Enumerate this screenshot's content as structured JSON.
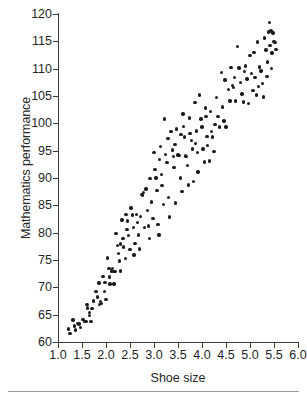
{
  "chart_data": {
    "type": "scatter",
    "title": "",
    "xlabel": "Shoe size",
    "ylabel": "Mathematics performance",
    "xlim": [
      1.0,
      6.0
    ],
    "ylim": [
      60,
      120
    ],
    "grid": false,
    "legend": null,
    "xticks": [
      "1.0",
      "1.5",
      "2.0",
      "2.5",
      "3.0",
      "3.5",
      "4.0",
      "4.5",
      "5.0",
      "5.5",
      "6.0"
    ],
    "xtick_values": [
      1.0,
      1.5,
      2.0,
      2.5,
      3.0,
      3.5,
      4.0,
      4.5,
      5.0,
      5.5,
      6.0
    ],
    "yticks": [
      "60",
      "65",
      "70",
      "75",
      "80",
      "85",
      "90",
      "95",
      "100",
      "105",
      "110",
      "115",
      "120"
    ],
    "ytick_values": [
      60,
      65,
      70,
      75,
      80,
      85,
      90,
      95,
      100,
      105,
      110,
      115,
      120
    ],
    "marker": "filled-circle",
    "marker_color": "#1c1c1c",
    "marker_size_px": 3.4,
    "n_points": 184,
    "points": [
      [
        1.22,
        62.4
      ],
      [
        1.25,
        61.6
      ],
      [
        1.31,
        64.0
      ],
      [
        1.34,
        62.9
      ],
      [
        1.36,
        62.2
      ],
      [
        1.44,
        63.3
      ],
      [
        1.47,
        62.6
      ],
      [
        1.52,
        64.1
      ],
      [
        1.55,
        63.8
      ],
      [
        1.58,
        63.7
      ],
      [
        1.6,
        66.9
      ],
      [
        1.62,
        66.2
      ],
      [
        1.66,
        65.4
      ],
      [
        1.69,
        63.8
      ],
      [
        1.71,
        66.1
      ],
      [
        1.74,
        67.5
      ],
      [
        1.79,
        69.2
      ],
      [
        1.82,
        68.2
      ],
      [
        1.85,
        70.8
      ],
      [
        1.86,
        66.9
      ],
      [
        1.88,
        67.4
      ],
      [
        1.9,
        67.0
      ],
      [
        1.94,
        72.0
      ],
      [
        1.98,
        70.9
      ],
      [
        2.0,
        67.8
      ],
      [
        2.03,
        75.4
      ],
      [
        2.06,
        73.4
      ],
      [
        2.08,
        70.6
      ],
      [
        2.11,
        73.0
      ],
      [
        2.13,
        73.4
      ],
      [
        2.15,
        72.9
      ],
      [
        2.17,
        70.6
      ],
      [
        2.19,
        72.9
      ],
      [
        2.21,
        79.8
      ],
      [
        2.24,
        77.6
      ],
      [
        2.26,
        76.2
      ],
      [
        2.28,
        74.8
      ],
      [
        2.3,
        73.0
      ],
      [
        2.33,
        82.3
      ],
      [
        2.35,
        78.9
      ],
      [
        2.37,
        77.4
      ],
      [
        2.4,
        75.3
      ],
      [
        2.42,
        83.3
      ],
      [
        2.45,
        82.1
      ],
      [
        2.47,
        79.5
      ],
      [
        2.5,
        76.9
      ],
      [
        2.52,
        84.5
      ],
      [
        2.55,
        83.2
      ],
      [
        2.57,
        81.0
      ],
      [
        2.6,
        78.0
      ],
      [
        2.63,
        83.3
      ],
      [
        2.66,
        81.9
      ],
      [
        2.68,
        79.6
      ],
      [
        2.7,
        77.0
      ],
      [
        2.74,
        87.0
      ],
      [
        2.76,
        86.9
      ],
      [
        2.78,
        87.3
      ],
      [
        2.8,
        80.9
      ],
      [
        2.83,
        88.0
      ],
      [
        2.86,
        84.1
      ],
      [
        2.88,
        81.2
      ],
      [
        2.92,
        89.9
      ],
      [
        2.95,
        85.6
      ],
      [
        2.98,
        82.6
      ],
      [
        3.0,
        94.7
      ],
      [
        3.02,
        91.6
      ],
      [
        3.04,
        90.0
      ],
      [
        3.06,
        87.7
      ],
      [
        3.08,
        81.5
      ],
      [
        3.1,
        79.6
      ],
      [
        3.12,
        93.4
      ],
      [
        3.15,
        90.6
      ],
      [
        3.17,
        88.6
      ],
      [
        3.2,
        85.2
      ],
      [
        3.22,
        100.8
      ],
      [
        3.24,
        94.3
      ],
      [
        3.27,
        92.8
      ],
      [
        3.3,
        86.4
      ],
      [
        3.32,
        82.9
      ],
      [
        3.35,
        98.5
      ],
      [
        3.38,
        95.1
      ],
      [
        3.4,
        93.9
      ],
      [
        3.42,
        91.9
      ],
      [
        3.45,
        85.4
      ],
      [
        3.47,
        99.0
      ],
      [
        3.5,
        94.2
      ],
      [
        3.52,
        94.1
      ],
      [
        3.55,
        90.0
      ],
      [
        3.58,
        87.5
      ],
      [
        3.6,
        101.7
      ],
      [
        3.62,
        99.4
      ],
      [
        3.64,
        97.5
      ],
      [
        3.66,
        94.0
      ],
      [
        3.68,
        93.9
      ],
      [
        3.7,
        92.3
      ],
      [
        3.72,
        88.7
      ],
      [
        3.75,
        98.1
      ],
      [
        3.78,
        96.9
      ],
      [
        3.8,
        95.3
      ],
      [
        3.82,
        89.4
      ],
      [
        3.85,
        103.8
      ],
      [
        3.88,
        98.6
      ],
      [
        3.9,
        94.7
      ],
      [
        3.92,
        91.1
      ],
      [
        3.95,
        105.2
      ],
      [
        3.98,
        100.8
      ],
      [
        4.0,
        99.3
      ],
      [
        4.02,
        95.3
      ],
      [
        4.05,
        92.9
      ],
      [
        4.08,
        101.2
      ],
      [
        4.1,
        97.6
      ],
      [
        4.12,
        96.0
      ],
      [
        4.15,
        93.1
      ],
      [
        4.18,
        102.2
      ],
      [
        4.2,
        98.5
      ],
      [
        4.22,
        97.5
      ],
      [
        4.25,
        94.8
      ],
      [
        4.3,
        104.7
      ],
      [
        4.33,
        101.2
      ],
      [
        4.36,
        99.3
      ],
      [
        4.4,
        109.3
      ],
      [
        4.43,
        103.0
      ],
      [
        4.46,
        100.4
      ],
      [
        4.5,
        99.3
      ],
      [
        4.55,
        106.2
      ],
      [
        4.58,
        104.1
      ],
      [
        4.6,
        110.2
      ],
      [
        4.63,
        106.9
      ],
      [
        4.66,
        106.6
      ],
      [
        4.7,
        104.1
      ],
      [
        4.74,
        114.1
      ],
      [
        4.77,
        110.1
      ],
      [
        4.8,
        107.5
      ],
      [
        4.83,
        105.4
      ],
      [
        4.86,
        103.9
      ],
      [
        4.9,
        110.5
      ],
      [
        4.94,
        108.1
      ],
      [
        4.97,
        103.6
      ],
      [
        5.0,
        112.4
      ],
      [
        5.03,
        109.1
      ],
      [
        5.06,
        106.0
      ],
      [
        5.1,
        108.4
      ],
      [
        5.13,
        105.2
      ],
      [
        5.16,
        114.9
      ],
      [
        5.2,
        110.3
      ],
      [
        5.23,
        109.6
      ],
      [
        5.26,
        107.3
      ],
      [
        5.3,
        115.6
      ],
      [
        5.33,
        113.4
      ],
      [
        5.36,
        111.2
      ],
      [
        5.38,
        116.7
      ],
      [
        5.4,
        118.5
      ],
      [
        5.42,
        114.2
      ],
      [
        5.44,
        116.9
      ],
      [
        5.46,
        112.9
      ],
      [
        5.48,
        116.5
      ],
      [
        5.5,
        115.0
      ],
      [
        5.52,
        114.8
      ],
      [
        5.54,
        113.5
      ],
      [
        2.44,
        80.6
      ],
      [
        2.58,
        75.9
      ],
      [
        2.72,
        83.0
      ],
      [
        2.9,
        78.9
      ],
      [
        3.14,
        95.8
      ],
      [
        3.29,
        97.2
      ],
      [
        3.44,
        96.1
      ],
      [
        3.56,
        98.0
      ],
      [
        3.74,
        101.0
      ],
      [
        3.86,
        96.3
      ],
      [
        4.07,
        102.8
      ],
      [
        4.27,
        99.8
      ],
      [
        4.48,
        107.9
      ],
      [
        4.68,
        108.4
      ],
      [
        4.88,
        109.5
      ],
      [
        5.08,
        113.0
      ],
      [
        5.18,
        106.7
      ],
      [
        5.28,
        104.8
      ],
      [
        5.35,
        108.6
      ],
      [
        5.45,
        110.0
      ],
      [
        2.07,
        71.9
      ],
      [
        2.3,
        77.9
      ],
      [
        1.41,
        63.4
      ],
      [
        1.65,
        64.9
      ],
      [
        1.97,
        69.2
      ]
    ]
  }
}
